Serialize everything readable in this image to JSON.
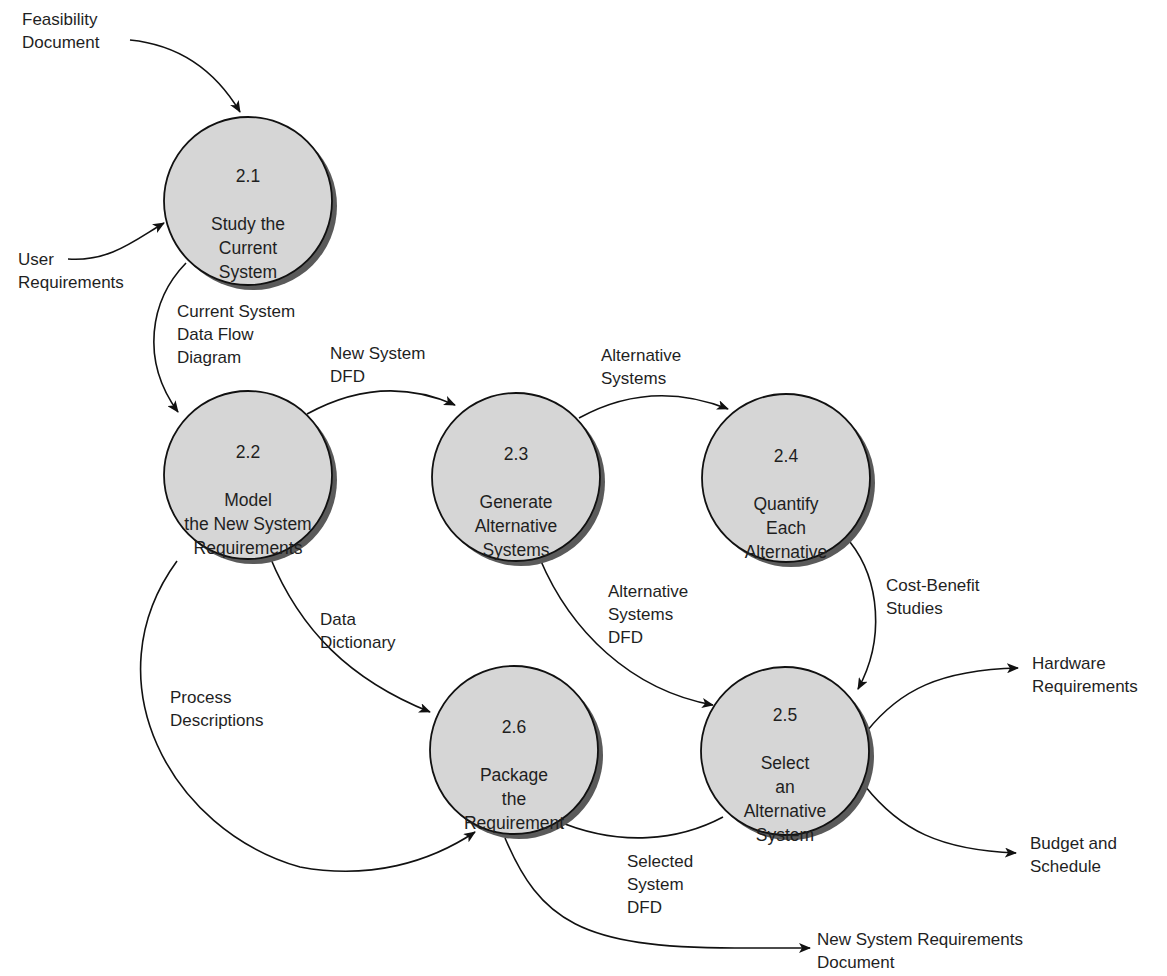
{
  "diagram": {
    "type": "data-flow-diagram",
    "colors": {
      "bubble_fill": "#d6d6d6",
      "bubble_shadow": "#5a5a5a",
      "line": "#111111",
      "background": "#ffffff"
    },
    "processes": [
      {
        "id": "2.1",
        "number": "2.1",
        "name": "Study the\nCurrent\nSystem",
        "cx": 248,
        "cy": 201,
        "r": 84
      },
      {
        "id": "2.2",
        "number": "2.2",
        "name": "Model\nthe New System\nRequirements",
        "cx": 248,
        "cy": 475,
        "r": 84
      },
      {
        "id": "2.3",
        "number": "2.3",
        "name": "Generate\nAlternative\nSystems",
        "cx": 516,
        "cy": 477,
        "r": 84
      },
      {
        "id": "2.4",
        "number": "2.4",
        "name": "Quantify\nEach\nAlternative",
        "cx": 786,
        "cy": 478,
        "r": 84
      },
      {
        "id": "2.5",
        "number": "2.5",
        "name": "Select\nan\nAlternative\nSystem",
        "cx": 785,
        "cy": 751,
        "r": 84
      },
      {
        "id": "2.6",
        "number": "2.6",
        "name": "Package\nthe\nRequirement",
        "cx": 514,
        "cy": 750,
        "r": 84
      }
    ],
    "external_inputs": [
      {
        "label": "Feasibility\nDocument",
        "to": "2.1"
      },
      {
        "label": "User\nRequirements",
        "to": "2.1"
      }
    ],
    "flows": [
      {
        "label": "Current System\nData Flow\nDiagram",
        "from": "2.1",
        "to": "2.2"
      },
      {
        "label": "New System\nDFD",
        "from": "2.2",
        "to": "2.3"
      },
      {
        "label": "Alternative\nSystems",
        "from": "2.3",
        "to": "2.4"
      },
      {
        "label": "Cost-Benefit\nStudies",
        "from": "2.4",
        "to": "2.5"
      },
      {
        "label": "Alternative\nSystems\nDFD",
        "from": "2.3",
        "to": "2.5"
      },
      {
        "label": "Data\nDictionary",
        "from": "2.2",
        "to": "2.6"
      },
      {
        "label": "Process\nDescriptions",
        "from": "2.2",
        "to": "2.6"
      },
      {
        "label": "Selected\nSystem\nDFD",
        "from": "2.5",
        "to": "2.6"
      }
    ],
    "outputs": [
      {
        "label": "Hardware\nRequirements",
        "from": "2.5"
      },
      {
        "label": "Budget and\nSchedule",
        "from": "2.5"
      },
      {
        "label": "New System Requirements\nDocument",
        "from": "2.6"
      }
    ]
  }
}
